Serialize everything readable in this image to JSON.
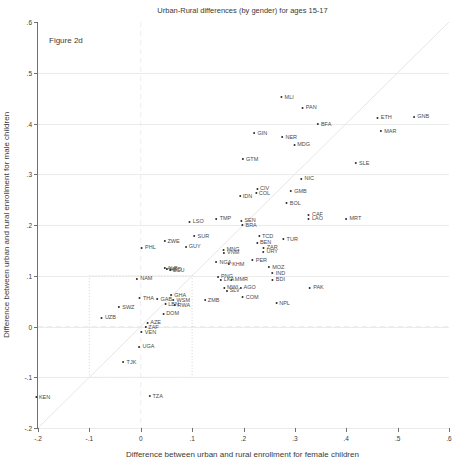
{
  "figure_label": "Figure 2d",
  "colors": {
    "background": "#ffffff",
    "axis": "#707070",
    "gridline": "#ebebeb",
    "marker": "#2a2a2a",
    "point_label": "#4a4a4a",
    "diagonal_line": "#8a8a8a",
    "dashed_reference": "#b0b0b0",
    "dotted_box": "#555555",
    "text": "#3a3a3a"
  },
  "chart_data": {
    "type": "scatter",
    "title": "Urban-Rural differences (by gender) for ages 15-17",
    "xlabel": "Difference between urban and rural enrollment for female children",
    "ylabel": "Difference between urban and rural enrollment for male children",
    "xlim": [
      -0.2,
      0.6
    ],
    "ylim": [
      -0.2,
      0.6
    ],
    "grid": "horizontal only",
    "legend": "none",
    "xticks": {
      "values": [
        -0.2,
        -0.1,
        0,
        0.1,
        0.2,
        0.3,
        0.4,
        0.5,
        0.6
      ],
      "labels": [
        "-.2",
        "-.1",
        "0",
        ".1",
        ".2",
        ".3",
        ".4",
        ".5",
        ".6"
      ]
    },
    "yticks": {
      "values": [
        -0.2,
        -0.1,
        0,
        0.1,
        0.2,
        0.3,
        0.4,
        0.5,
        0.6
      ],
      "labels": [
        "-.2",
        "-.1",
        "0",
        ".1",
        ".2",
        ".3",
        ".4",
        ".5",
        ".6"
      ]
    },
    "reference_lines": {
      "diagonal": {
        "description": "y = x line from (-0.2,-0.2) to (0.6,0.6)"
      },
      "vertical_dashed_at_x": 0,
      "horizontal_dashed_at_y": 0,
      "dotted_box": {
        "x1": -0.1,
        "y1": -0.1,
        "x2": 0.1,
        "y2": 0.1
      }
    },
    "points": [
      {
        "label": "MLI",
        "x": 0.285,
        "y": 0.453
      },
      {
        "label": "PAN",
        "x": 0.328,
        "y": 0.433
      },
      {
        "label": "BFA",
        "x": 0.357,
        "y": 0.4
      },
      {
        "label": "ETH",
        "x": 0.474,
        "y": 0.413
      },
      {
        "label": "GNB",
        "x": 0.546,
        "y": 0.415
      },
      {
        "label": "MAR",
        "x": 0.482,
        "y": 0.386
      },
      {
        "label": "GIN",
        "x": 0.233,
        "y": 0.382
      },
      {
        "label": "NER",
        "x": 0.289,
        "y": 0.374
      },
      {
        "label": "MDG",
        "x": 0.313,
        "y": 0.36
      },
      {
        "label": "GTM",
        "x": 0.213,
        "y": 0.331
      },
      {
        "label": "SLE",
        "x": 0.431,
        "y": 0.323
      },
      {
        "label": "NIC",
        "x": 0.324,
        "y": 0.293
      },
      {
        "label": "GMB",
        "x": 0.307,
        "y": 0.268
      },
      {
        "label": "CIV",
        "x": 0.237,
        "y": 0.272
      },
      {
        "label": "COL",
        "x": 0.237,
        "y": 0.264
      },
      {
        "label": "IDN",
        "x": 0.204,
        "y": 0.258
      },
      {
        "label": "BOL",
        "x": 0.297,
        "y": 0.244
      },
      {
        "label": "CAF",
        "x": 0.34,
        "y": 0.221
      },
      {
        "label": "LAO",
        "x": 0.34,
        "y": 0.213
      },
      {
        "label": "MRT",
        "x": 0.414,
        "y": 0.213
      },
      {
        "label": "TMP",
        "x": 0.161,
        "y": 0.213
      },
      {
        "label": "LSO",
        "x": 0.108,
        "y": 0.207
      },
      {
        "label": "SEN",
        "x": 0.209,
        "y": 0.209
      },
      {
        "label": "BRA",
        "x": 0.211,
        "y": 0.201
      },
      {
        "label": "SUR",
        "x": 0.118,
        "y": 0.179
      },
      {
        "label": "ZWE",
        "x": 0.06,
        "y": 0.169
      },
      {
        "label": "GUY",
        "x": 0.101,
        "y": 0.159
      },
      {
        "label": "PHL",
        "x": 0.015,
        "y": 0.156
      },
      {
        "label": "TCD",
        "x": 0.243,
        "y": 0.179
      },
      {
        "label": "BEN",
        "x": 0.239,
        "y": 0.167
      },
      {
        "label": "TUR",
        "x": 0.291,
        "y": 0.173
      },
      {
        "label": "ZAR",
        "x": 0.252,
        "y": 0.156
      },
      {
        "label": "URY",
        "x": 0.252,
        "y": 0.148
      },
      {
        "label": "MNG",
        "x": 0.176,
        "y": 0.152
      },
      {
        "label": "VNM",
        "x": 0.176,
        "y": 0.146
      },
      {
        "label": "NGA",
        "x": 0.161,
        "y": 0.128
      },
      {
        "label": "KHM",
        "x": 0.186,
        "y": 0.124
      },
      {
        "label": "PER",
        "x": 0.231,
        "y": 0.132
      },
      {
        "label": "MOZ",
        "x": 0.264,
        "y": 0.118
      },
      {
        "label": "IND",
        "x": 0.268,
        "y": 0.106
      },
      {
        "label": "BDI",
        "x": 0.268,
        "y": 0.094
      },
      {
        "label": "PAK",
        "x": 0.342,
        "y": 0.077
      },
      {
        "label": "MMR",
        "x": 0.192,
        "y": 0.094
      },
      {
        "label": "PNG",
        "x": 0.164,
        "y": 0.1
      },
      {
        "label": "LKA",
        "x": 0.168,
        "y": 0.094
      },
      {
        "label": "MWI",
        "x": 0.175,
        "y": 0.077
      },
      {
        "label": "SLV",
        "x": 0.179,
        "y": 0.071
      },
      {
        "label": "AGO",
        "x": 0.208,
        "y": 0.077
      },
      {
        "label": "COM",
        "x": 0.213,
        "y": 0.059
      },
      {
        "label": "ZMB",
        "x": 0.138,
        "y": 0.053
      },
      {
        "label": "NPL",
        "x": 0.276,
        "y": 0.047
      },
      {
        "label": "ALB",
        "x": 0.058,
        "y": 0.116
      },
      {
        "label": "MKD",
        "x": 0.064,
        "y": 0.114
      },
      {
        "label": "ECU",
        "x": 0.07,
        "y": 0.112
      },
      {
        "label": "NAM",
        "x": 0.007,
        "y": 0.096
      },
      {
        "label": "THA",
        "x": 0.011,
        "y": 0.057
      },
      {
        "label": "GAB",
        "x": 0.046,
        "y": 0.055
      },
      {
        "label": "GHA",
        "x": 0.073,
        "y": 0.063
      },
      {
        "label": "WSM",
        "x": 0.079,
        "y": 0.053
      },
      {
        "label": "LBN",
        "x": 0.06,
        "y": 0.045
      },
      {
        "label": "RWA",
        "x": 0.08,
        "y": 0.043
      },
      {
        "label": "DOM",
        "x": 0.058,
        "y": 0.026
      },
      {
        "label": "SWZ",
        "x": -0.028,
        "y": 0.039
      },
      {
        "label": "UZB",
        "x": -0.063,
        "y": 0.018
      },
      {
        "label": "AZE",
        "x": 0.025,
        "y": 0.008
      },
      {
        "label": "ZAF",
        "x": 0.021,
        "y": 0.0
      },
      {
        "label": "VEN",
        "x": 0.015,
        "y": -0.01
      },
      {
        "label": "UGA",
        "x": 0.011,
        "y": -0.039
      },
      {
        "label": "TJK",
        "x": -0.022,
        "y": -0.069
      },
      {
        "label": "TZA",
        "x": 0.029,
        "y": -0.136
      },
      {
        "label": "KEN",
        "x": -0.191,
        "y": -0.138
      }
    ]
  }
}
